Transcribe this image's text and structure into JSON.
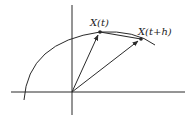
{
  "diagram": {
    "type": "vector-curve-secant",
    "labels": {
      "point_t": "X(t)",
      "point_t_h": "X(t+h)"
    },
    "colors": {
      "stroke": "#2a2a2a",
      "background": "#ffffff"
    },
    "elements": [
      "x-axis",
      "y-axis",
      "curve",
      "vector-to-X(t)",
      "vector-to-X(t+h)",
      "secant-chord"
    ]
  }
}
